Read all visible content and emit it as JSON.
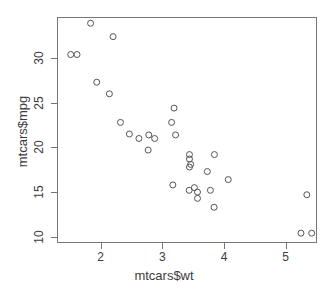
{
  "chart_data": {
    "type": "scatter",
    "title": "",
    "xlabel": "mtcars$wt",
    "ylabel": "mtcars$mpg",
    "xlim": [
      1.29,
      5.51
    ],
    "ylim": [
      9.3,
      34.6
    ],
    "xticks": [
      2,
      3,
      4,
      5
    ],
    "yticks": [
      10,
      15,
      20,
      25,
      30
    ],
    "xtick_labels": [
      "2",
      "3",
      "4",
      "5"
    ],
    "ytick_labels": [
      "10",
      "15",
      "20",
      "25",
      "30"
    ],
    "grid": false,
    "legend": null,
    "marker": "open-circle",
    "marker_color": "#555555",
    "marker_size_px": 6,
    "background": "#ffffff",
    "frame_color": "#777777",
    "n_points": 32,
    "x": [
      2.62,
      2.875,
      2.32,
      3.215,
      3.44,
      3.46,
      3.57,
      3.19,
      3.15,
      3.44,
      3.44,
      4.07,
      3.73,
      3.78,
      5.25,
      5.424,
      5.345,
      2.2,
      1.615,
      1.835,
      2.465,
      3.52,
      3.435,
      3.84,
      3.845,
      1.935,
      2.14,
      1.513,
      3.17,
      2.77,
      3.57,
      2.78
    ],
    "y": [
      21.0,
      21.0,
      22.8,
      21.4,
      18.7,
      18.1,
      14.3,
      24.4,
      22.8,
      19.2,
      17.8,
      16.4,
      17.3,
      15.2,
      10.4,
      10.4,
      14.7,
      32.4,
      30.4,
      33.9,
      21.5,
      15.5,
      15.2,
      13.3,
      19.2,
      27.3,
      26.0,
      30.4,
      15.8,
      19.7,
      15.0,
      21.4
    ]
  },
  "axis": {
    "x_title": "mtcars$wt",
    "y_title": "mtcars$mpg"
  }
}
